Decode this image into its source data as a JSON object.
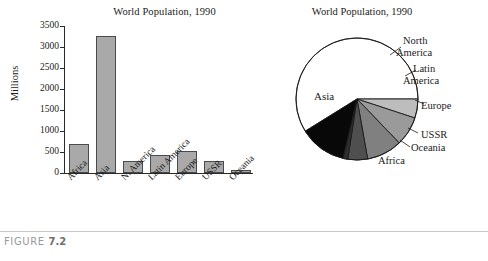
{
  "figure": {
    "caption_prefix": "FIGURE",
    "caption_number": "7.2"
  },
  "chart_data": [
    {
      "type": "bar",
      "title": "World Population, 1990",
      "xlabel": "",
      "ylabel": "Millions",
      "categories": [
        "Africa",
        "Asia",
        "N. America",
        "Latin America",
        "Europe",
        "USSR",
        "Oceania"
      ],
      "values": [
        690,
        3260,
        280,
        430,
        520,
        290,
        70
      ],
      "ylim": [
        0,
        3500
      ],
      "yticks": [
        0,
        500,
        1000,
        1500,
        2000,
        2500,
        3000,
        3500
      ],
      "ytick_labels": [
        "0",
        "500",
        "1000",
        "1500",
        "2000",
        "2500",
        "3000",
        "3500"
      ],
      "grid": false,
      "legend": "none",
      "bar_fill": "#a9a9a9",
      "bar_edge": "#4a4a4a",
      "axis_color": "#2a2a2a"
    },
    {
      "type": "pie",
      "title": "World Population, 1990",
      "labels": [
        "Asia",
        "North America",
        "Latin America",
        "Europe",
        "USSR",
        "Oceania",
        "Africa"
      ],
      "values": [
        3260,
        280,
        430,
        520,
        290,
        70,
        690
      ],
      "colors": [
        "#ffffff",
        "#bdbdbd",
        "#9a9a9a",
        "#808080",
        "#4f4f4f",
        "#2e2e2e",
        "#080808"
      ],
      "start_angle_deg": 0,
      "direction": "clockwise",
      "edge_color": "#1a1a1a",
      "legend": "labels-around-pie"
    }
  ],
  "bar_chart": {
    "title": "World Population, 1990",
    "ylabel": "Millions",
    "ytick_labels": [
      "3500",
      "3000",
      "2500",
      "2000",
      "1500",
      "1000",
      "500",
      "0"
    ],
    "bars": [
      {
        "label": "Africa",
        "value": 690
      },
      {
        "label": "Asia",
        "value": 3260
      },
      {
        "label": "N. America",
        "value": 280
      },
      {
        "label": "Latin America",
        "value": 430
      },
      {
        "label": "Europe",
        "value": 520
      },
      {
        "label": "USSR",
        "value": 290
      },
      {
        "label": "Oceania",
        "value": 70
      }
    ]
  },
  "pie_chart": {
    "title": "World Population, 1990",
    "slices": [
      {
        "label": "Asia",
        "value": 3260,
        "color": "#ffffff"
      },
      {
        "label": "North America",
        "value": 280,
        "color": "#bdbdbd"
      },
      {
        "label": "Latin America",
        "value": 430,
        "color": "#9a9a9a"
      },
      {
        "label": "Europe",
        "value": 520,
        "color": "#808080"
      },
      {
        "label": "USSR",
        "value": 290,
        "color": "#4f4f4f"
      },
      {
        "label": "Oceania",
        "value": 70,
        "color": "#2e2e2e"
      },
      {
        "label": "Africa",
        "value": 690,
        "color": "#080808"
      }
    ],
    "callouts": {
      "asia": "Asia",
      "north_america_line1": "North",
      "north_america_line2": "America",
      "latin_america_line1": "Latin",
      "latin_america_line2": "America",
      "europe": "Europe",
      "ussr": "USSR",
      "oceania": "Oceania",
      "africa": "Africa"
    }
  }
}
